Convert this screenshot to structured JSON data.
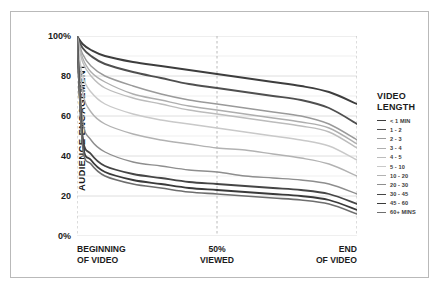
{
  "chart_data": {
    "type": "line",
    "title": "",
    "xlabel": "",
    "ylabel": "AUDIENCE ENGAGEMENT",
    "ylim": [
      0,
      100
    ],
    "xlim": [
      0,
      100
    ],
    "grid": true,
    "legend_position": "right",
    "legend_title_line1": "VIDEO",
    "legend_title_line2": "LENGTH",
    "y_ticks": [
      {
        "value": 100,
        "label": "100%"
      },
      {
        "value": 80,
        "label": "80"
      },
      {
        "value": 60,
        "label": "60"
      },
      {
        "value": 40,
        "label": "40"
      },
      {
        "value": 20,
        "label": "20"
      },
      {
        "value": 0,
        "label": "0%"
      }
    ],
    "x_ticks": [
      {
        "value": 0,
        "line1": "BEGINNING",
        "line2": "OF VIDEO"
      },
      {
        "value": 50,
        "line1": "50%",
        "line2": "VIEWED"
      },
      {
        "value": 100,
        "line1": "END",
        "line2": "OF VIDEO"
      }
    ],
    "x": [
      0,
      2,
      5,
      10,
      20,
      30,
      40,
      50,
      60,
      70,
      80,
      90,
      100
    ],
    "series": [
      {
        "name": "< 1 MIN",
        "color": "#3d3d3d",
        "width": 1.9,
        "values": [
          100,
          96,
          93,
          90,
          87,
          85,
          83,
          81,
          79,
          77,
          75,
          72,
          66
        ]
      },
      {
        "name": "1 - 2",
        "color": "#4f4f4f",
        "width": 1.9,
        "values": [
          100,
          94,
          90,
          86,
          82,
          79,
          76,
          74,
          72,
          70,
          68,
          64,
          56
        ]
      },
      {
        "name": "2 - 3",
        "color": "#9a9a9a",
        "width": 1.5,
        "values": [
          100,
          91,
          85,
          80,
          75,
          71,
          68,
          66,
          64,
          62,
          60,
          56,
          48
        ]
      },
      {
        "name": "3 - 4",
        "color": "#aeaeae",
        "width": 1.4,
        "values": [
          100,
          89,
          82,
          77,
          71,
          68,
          65,
          63,
          61,
          59,
          57,
          54,
          46
        ]
      },
      {
        "name": "4 - 5",
        "color": "#bcbcbc",
        "width": 1.4,
        "values": [
          100,
          87,
          80,
          74,
          69,
          66,
          63,
          61,
          59,
          57,
          55,
          52,
          44
        ]
      },
      {
        "name": "5 - 10",
        "color": "#c9c9c9",
        "width": 1.4,
        "values": [
          100,
          80,
          72,
          66,
          61,
          58,
          56,
          54,
          52,
          50,
          48,
          45,
          38
        ]
      },
      {
        "name": "10 - 20",
        "color": "#b2b2b2",
        "width": 1.4,
        "values": [
          100,
          72,
          62,
          56,
          51,
          48,
          46,
          44,
          43,
          41,
          39,
          36,
          30
        ]
      },
      {
        "name": "20 - 30",
        "color": "#8e8e8e",
        "width": 1.4,
        "values": [
          100,
          58,
          48,
          42,
          37,
          35,
          33,
          32,
          30,
          29,
          28,
          26,
          21
        ]
      },
      {
        "name": "30 - 45",
        "color": "#454545",
        "width": 1.8,
        "values": [
          100,
          50,
          41,
          35,
          31,
          29,
          27,
          26,
          25,
          24,
          23,
          21,
          16
        ]
      },
      {
        "name": "45 - 60",
        "color": "#3a3a3a",
        "width": 1.8,
        "values": [
          100,
          47,
          38,
          32,
          28,
          26,
          24,
          23,
          22,
          21,
          20,
          18,
          13
        ]
      },
      {
        "name": "60+ MINS",
        "color": "#6e6e6e",
        "width": 1.6,
        "values": [
          100,
          45,
          36,
          30,
          26,
          24,
          22,
          21,
          20,
          19,
          18,
          16,
          11
        ]
      }
    ]
  }
}
